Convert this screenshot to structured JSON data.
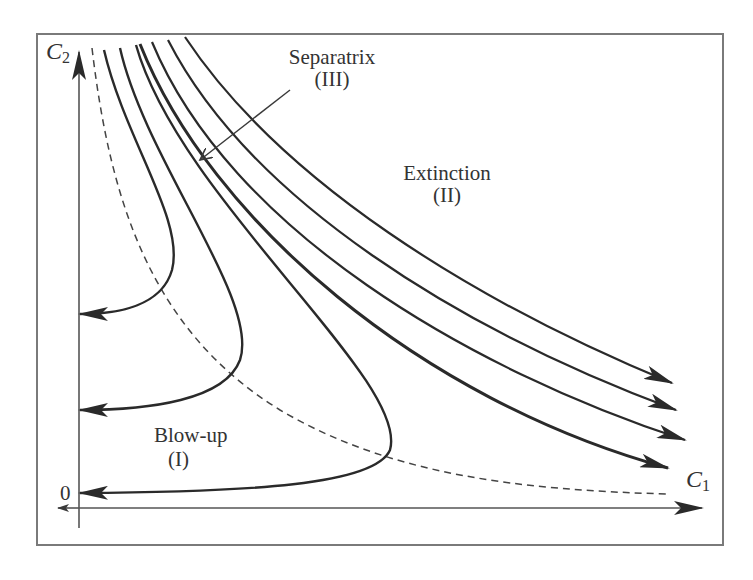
{
  "figure": {
    "axes": {
      "x_label_main": "C",
      "x_label_sub": "1",
      "y_label_main": "C",
      "y_label_sub": "2",
      "origin_label": "0"
    },
    "regions": {
      "blowup": {
        "line1": "Blow-up",
        "line2": "(I)"
      },
      "extinction": {
        "line1": "Extinction",
        "line2": "(II)"
      },
      "separatrix": {
        "line1": "Separatrix",
        "line2": "(III)"
      }
    },
    "colors": {
      "curve": "#2a2a2a",
      "frame": "#7a7a7a",
      "text": "#333333",
      "dashed": "#444444"
    },
    "curves": {
      "blowup_count": 3,
      "extinction_count": 4,
      "separatrix": "dashed"
    }
  }
}
